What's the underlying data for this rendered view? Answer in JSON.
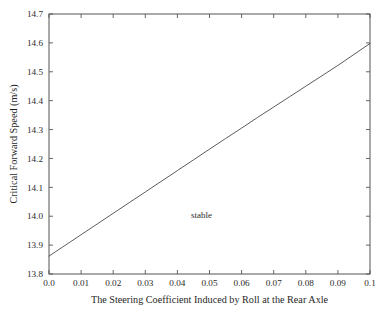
{
  "chart_data": {
    "type": "line",
    "title": "",
    "subtitle": "",
    "xlabel": "The Steering Coefficient Induced by Roll at the Rear Axle",
    "ylabel": "Critical Forward Speed (m/s)",
    "xlim": [
      0.0,
      0.1
    ],
    "ylim": [
      13.8,
      14.7
    ],
    "grid": false,
    "legend": null,
    "legend_position": "none",
    "line_color": "#4a4a4a",
    "frame_color": "#555555",
    "background_color": "#ffffff",
    "xticks": [
      "0.0",
      "0.01",
      "0.02",
      "0.03",
      "0.04",
      "0.05",
      "0.06",
      "0.07",
      "0.08",
      "0.09",
      "0.1"
    ],
    "xtick_values": [
      0.0,
      0.01,
      0.02,
      0.03,
      0.04,
      0.05,
      0.06,
      0.07,
      0.08,
      0.09,
      0.1
    ],
    "yticks": [
      "13.8",
      "13.9",
      "14.0",
      "14.1",
      "14.2",
      "14.3",
      "14.4",
      "14.5",
      "14.6",
      "14.7"
    ],
    "ytick_values": [
      13.8,
      13.9,
      14.0,
      14.1,
      14.2,
      14.3,
      14.4,
      14.5,
      14.6,
      14.7
    ],
    "series": [
      {
        "name": "critical forward speed",
        "x": [
          0.0,
          0.005,
          0.01,
          0.015,
          0.02,
          0.025,
          0.03,
          0.035,
          0.04,
          0.045,
          0.05,
          0.055,
          0.06,
          0.065,
          0.07,
          0.075,
          0.08,
          0.085,
          0.09,
          0.095,
          0.1
        ],
        "values": [
          13.862,
          13.899,
          13.936,
          13.973,
          14.01,
          14.047,
          14.084,
          14.121,
          14.158,
          14.195,
          14.232,
          14.269,
          14.305,
          14.342,
          14.378,
          14.414,
          14.45,
          14.486,
          14.522,
          14.56,
          14.598
        ]
      }
    ],
    "annotations": [
      {
        "text": "stable",
        "x": 0.0475,
        "y": 13.995
      }
    ]
  }
}
